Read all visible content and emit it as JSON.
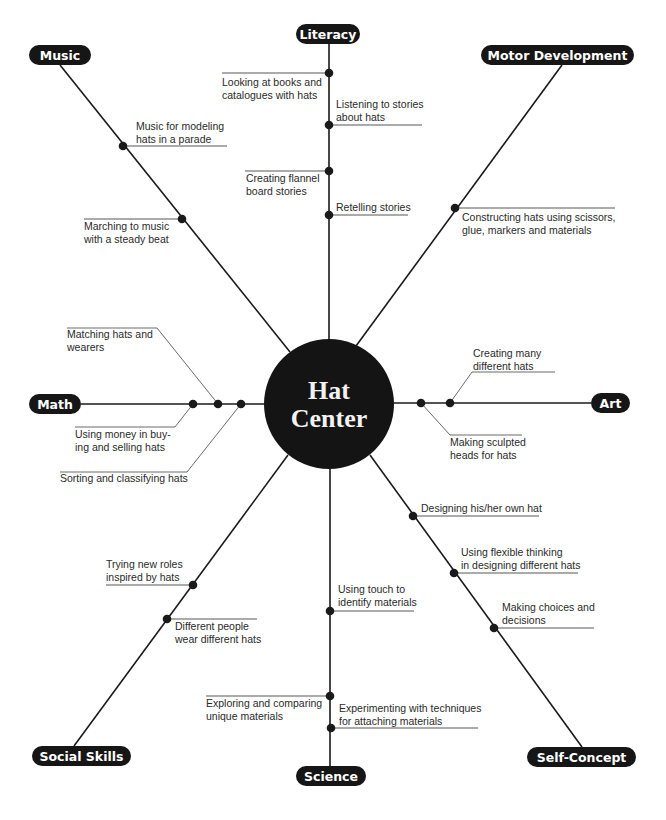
{
  "title": "Hat Center",
  "center": {
    "line1": "Hat",
    "line2": "Center",
    "x": 329,
    "y": 404,
    "r": 65
  },
  "colors": {
    "ink": "#161616",
    "line": "#1a1a1a",
    "text": "#2a2a2a",
    "background": "#ffffff"
  },
  "branches": [
    {
      "id": "literacy",
      "label": "Literacy",
      "pill": {
        "x": 296,
        "y": 24,
        "w": 64,
        "h": 20
      },
      "spoke": {
        "x1": 329,
        "y1": 44,
        "x2": 329,
        "y2": 339
      },
      "items": [
        {
          "text": [
            "Looking at books and",
            "catalogues with hats"
          ],
          "dot": [
            329,
            73
          ],
          "uline": [
            222,
            73,
            329,
            73
          ],
          "tx": 222,
          "ty": 86
        },
        {
          "text": [
            "Listening to stories",
            "about hats"
          ],
          "dot": [
            329,
            125
          ],
          "uline": [
            329,
            125,
            422,
            125
          ],
          "tx": 336,
          "ty": 108
        },
        {
          "text": [
            "Creating flannel",
            "board stories"
          ],
          "dot": [
            329,
            171
          ],
          "uline": [
            245,
            171,
            329,
            171
          ],
          "tx": 246,
          "ty": 182
        },
        {
          "text": [
            "Retelling stories"
          ],
          "dot": [
            329,
            215
          ],
          "uline": [
            329,
            215,
            408,
            215
          ],
          "tx": 336,
          "ty": 211
        }
      ]
    },
    {
      "id": "music",
      "label": "Music",
      "pill": {
        "x": 29,
        "y": 45,
        "w": 62,
        "h": 20
      },
      "spoke": {
        "x1": 60,
        "y1": 65,
        "x2": 290,
        "y2": 352
      },
      "items": [
        {
          "text": [
            "Music for modeling",
            "hats in a parade"
          ],
          "dot": [
            123,
            146
          ],
          "uline": [
            123,
            146,
            227,
            146
          ],
          "tx": 136,
          "ty": 130
        },
        {
          "text": [
            "Marching to music",
            "with a steady beat"
          ],
          "dot": [
            182,
            219
          ],
          "uline": [
            84,
            219,
            182,
            219
          ],
          "tx": 84,
          "ty": 230
        }
      ]
    },
    {
      "id": "motor",
      "label": "Motor Development",
      "pill": {
        "x": 481,
        "y": 45,
        "w": 153,
        "h": 20
      },
      "spoke": {
        "x1": 562,
        "y1": 65,
        "x2": 356,
        "y2": 346
      },
      "items": [
        {
          "text": [
            "Constructing hats using scissors,",
            "glue, markers and materials"
          ],
          "dot": [
            455,
            208
          ],
          "uline": [
            455,
            208,
            615,
            208
          ],
          "tx": 462,
          "ty": 221
        }
      ]
    },
    {
      "id": "math",
      "label": "Math",
      "pill": {
        "x": 29,
        "y": 394,
        "w": 52,
        "h": 20
      },
      "spoke": {
        "x1": 81,
        "y1": 404,
        "x2": 264,
        "y2": 404
      },
      "items": [
        {
          "text": [
            "Matching hats and",
            "wearers"
          ],
          "dot": [
            218,
            404
          ],
          "leader": [
            218,
            404,
            157,
            328,
            67,
            328
          ],
          "tx": 67,
          "ty": 338
        },
        {
          "text": [
            "Using money in buy-",
            "ing and selling hats"
          ],
          "dot": [
            193,
            404
          ],
          "leader": [
            193,
            404,
            175,
            427,
            75,
            427
          ],
          "tx": 75,
          "ty": 438
        },
        {
          "text": [
            "Sorting and classifying hats"
          ],
          "dot": [
            241,
            404
          ],
          "leader": [
            241,
            404,
            187,
            472,
            60,
            472
          ],
          "tx": 60,
          "ty": 482
        }
      ]
    },
    {
      "id": "art",
      "label": "Art",
      "pill": {
        "x": 591,
        "y": 393,
        "w": 39,
        "h": 20
      },
      "spoke": {
        "x1": 394,
        "y1": 403,
        "x2": 591,
        "y2": 403
      },
      "items": [
        {
          "text": [
            "Creating many",
            "different hats"
          ],
          "dot": [
            450,
            403
          ],
          "leader": [
            450,
            403,
            472,
            372,
            555,
            372
          ],
          "tx": 473,
          "ty": 357
        },
        {
          "text": [
            "Making sculpted",
            "heads for hats"
          ],
          "dot": [
            421,
            403
          ],
          "leader": [
            421,
            403,
            450,
            435,
            522,
            435
          ],
          "tx": 450,
          "ty": 446
        }
      ]
    },
    {
      "id": "social",
      "label": "Social Skills",
      "pill": {
        "x": 32,
        "y": 746,
        "w": 99,
        "h": 20
      },
      "spoke": {
        "x1": 74,
        "y1": 746,
        "x2": 288,
        "y2": 455
      },
      "items": [
        {
          "text": [
            "Trying new roles",
            "inspired by hats"
          ],
          "dot": [
            193,
            585
          ],
          "uline": [
            106,
            585,
            193,
            585
          ],
          "tx": 106,
          "ty": 568
        },
        {
          "text": [
            "Different people",
            "wear different hats"
          ],
          "dot": [
            167,
            619
          ],
          "uline": [
            167,
            619,
            257,
            619
          ],
          "tx": 175,
          "ty": 630
        }
      ]
    },
    {
      "id": "science",
      "label": "Science",
      "pill": {
        "x": 296,
        "y": 766,
        "w": 70,
        "h": 20
      },
      "spoke": {
        "x1": 330,
        "y1": 469,
        "x2": 330,
        "y2": 766
      },
      "items": [
        {
          "text": [
            "Using touch to",
            "identify materials"
          ],
          "dot": [
            330,
            611
          ],
          "uline": [
            330,
            611,
            414,
            611
          ],
          "tx": 338,
          "ty": 593
        },
        {
          "text": [
            "Exploring and comparing",
            "unique materials"
          ],
          "dot": [
            330,
            696
          ],
          "uline": [
            206,
            696,
            330,
            696
          ],
          "tx": 206,
          "ty": 707
        },
        {
          "text": [
            "Experimenting with techniques",
            "for attaching materials"
          ],
          "dot": [
            331,
            728
          ],
          "uline": [
            331,
            728,
            478,
            728
          ],
          "tx": 339,
          "ty": 712
        }
      ]
    },
    {
      "id": "self",
      "label": "Self-Concept",
      "pill": {
        "x": 527,
        "y": 747,
        "w": 109,
        "h": 20
      },
      "spoke": {
        "x1": 370,
        "y1": 455,
        "x2": 582,
        "y2": 747
      },
      "items": [
        {
          "text": [
            "Designing his/her own hat"
          ],
          "dot": [
            413,
            516
          ],
          "uline": [
            413,
            516,
            539,
            516
          ],
          "tx": 421,
          "ty": 512
        },
        {
          "text": [
            "Using flexible thinking",
            "in designing different hats"
          ],
          "dot": [
            454,
            573
          ],
          "uline": [
            454,
            573,
            578,
            573
          ],
          "tx": 461,
          "ty": 556
        },
        {
          "text": [
            "Making choices and",
            "decisions"
          ],
          "dot": [
            494,
            628
          ],
          "uline": [
            494,
            628,
            594,
            628
          ],
          "tx": 502,
          "ty": 611
        }
      ]
    }
  ]
}
